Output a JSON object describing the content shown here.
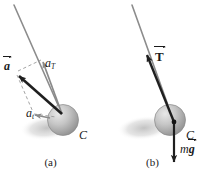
{
  "figure": {
    "width": 203,
    "height": 179,
    "background": "#ffffff"
  },
  "colors": {
    "cord": "#8c8c8c",
    "vector_dark": "#1f1f1f",
    "vector_gray": "#8a8a8a",
    "dashed": "#9a9a9a",
    "ball_light": "#d9d9d9",
    "ball_mid": "#b0b0b0",
    "ball_dark": "#8f8f8f",
    "shadow": "#c9c9c9",
    "text": "#1a1a1a"
  },
  "panels": [
    {
      "id": "a",
      "caption": "(a)",
      "center_label": "C",
      "vectors": [
        {
          "name": "total-acceleration",
          "symbol": "a",
          "style": "bold-vector",
          "color": "#1f1f1f",
          "description": "resultant acceleration vector"
        },
        {
          "name": "tangential-acceleration",
          "symbol": "a",
          "subscript": "T",
          "style": "italic-subscript",
          "color": "#8a8a8a",
          "description": "tangential component of acceleration"
        },
        {
          "name": "radial-acceleration",
          "symbol": "a",
          "subscript": "t",
          "style": "italic-subscript",
          "color": "#8a8a8a",
          "description": "second acceleration component"
        }
      ]
    },
    {
      "id": "b",
      "caption": "(b)",
      "center_label": "C",
      "vectors": [
        {
          "name": "tension",
          "symbol": "T",
          "style": "bold-vector",
          "color": "#1f1f1f",
          "description": "cord tension force along the string"
        },
        {
          "name": "weight",
          "symbol": "m",
          "symbol2": "g",
          "style": "italic-plus-bold-vector",
          "color": "#1f1f1f",
          "description": "gravitational force, mass times g"
        }
      ]
    }
  ],
  "labels": {
    "a_vector": "a",
    "a_T_base": "a",
    "a_T_sub": "T",
    "a_t_base": "a",
    "a_t_sub": "t",
    "C_a": "C",
    "C_b": "C",
    "T_vector": "T",
    "mg_m": "m",
    "mg_g": "g",
    "caption_a": "(a)",
    "caption_b": "(b)"
  }
}
